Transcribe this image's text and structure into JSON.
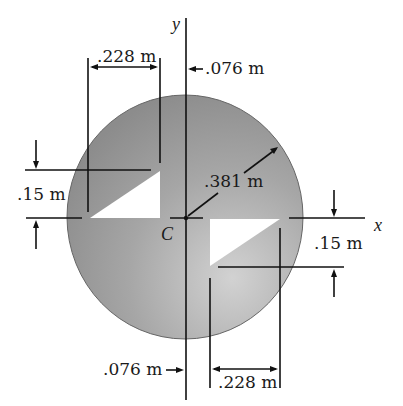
{
  "figure": {
    "type": "section-properties-diagram",
    "shape": "circular area with two right-triangular cutouts",
    "fill_color": "#9a9a9a",
    "fill_color_light": "#c8c8c8",
    "axes": {
      "y_label": "y",
      "x_label": "x",
      "centroid_label": "C"
    },
    "dimensions": {
      "radius": ".381 m",
      "top_width": ".228 m",
      "top_offset": ".076 m",
      "left_height": ".15 m",
      "right_height": ".15 m",
      "bottom_offset": ".076 m",
      "bottom_width": ".228 m"
    }
  }
}
